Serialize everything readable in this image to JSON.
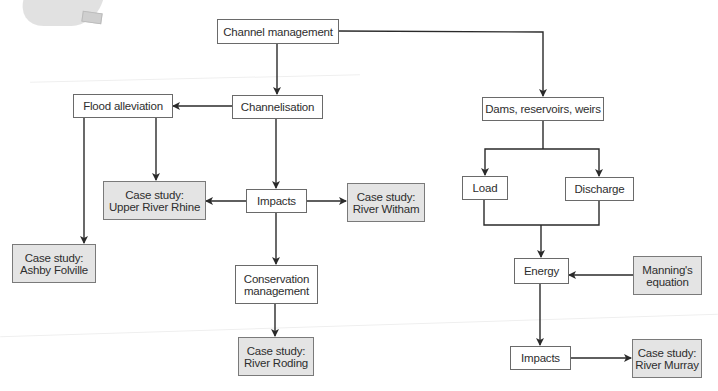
{
  "diagram": {
    "title": "Channel management",
    "colors": {
      "process_fill": "#ffffff",
      "case_study_fill": "#e4e4e4",
      "border": "#6a6a6a",
      "arrow": "#2a2a2a"
    },
    "nodes": {
      "channel_management": {
        "lines": [
          "Channel management"
        ],
        "type": "process"
      },
      "channelisation": {
        "lines": [
          "Channelisation"
        ],
        "type": "process"
      },
      "flood_alleviation": {
        "lines": [
          "Flood alleviation"
        ],
        "type": "process"
      },
      "impacts_left": {
        "lines": [
          "Impacts"
        ],
        "type": "process"
      },
      "case_upper_rhine": {
        "lines": [
          "Case study:",
          "Upper River Rhine"
        ],
        "type": "case_study"
      },
      "case_witham": {
        "lines": [
          "Case study:",
          "River Witham"
        ],
        "type": "case_study"
      },
      "case_ashby": {
        "lines": [
          "Case study:",
          "Ashby Folville"
        ],
        "type": "case_study"
      },
      "conservation_management": {
        "lines": [
          "Conservation",
          "management"
        ],
        "type": "process"
      },
      "case_roding": {
        "lines": [
          "Case study:",
          "River Roding"
        ],
        "type": "case_study"
      },
      "dams": {
        "lines": [
          "Dams, reservoirs, weirs"
        ],
        "type": "process"
      },
      "load": {
        "lines": [
          "Load"
        ],
        "type": "process"
      },
      "discharge": {
        "lines": [
          "Discharge"
        ],
        "type": "process"
      },
      "energy": {
        "lines": [
          "Energy"
        ],
        "type": "process"
      },
      "mannings": {
        "lines": [
          "Manning's",
          "equation"
        ],
        "type": "case_study"
      },
      "impacts_right": {
        "lines": [
          "Impacts"
        ],
        "type": "process"
      },
      "case_murray": {
        "lines": [
          "Case study:",
          "River Murray"
        ],
        "type": "case_study"
      }
    },
    "edges": [
      {
        "from": "Channel management",
        "to": "Channelisation"
      },
      {
        "from": "Channel management",
        "to": "Dams, reservoirs, weirs"
      },
      {
        "from": "Channelisation",
        "to": "Flood alleviation"
      },
      {
        "from": "Channelisation",
        "to": "Impacts"
      },
      {
        "from": "Flood alleviation",
        "to": "Case study: Upper River Rhine"
      },
      {
        "from": "Flood alleviation",
        "to": "Case study: Ashby Folville"
      },
      {
        "from": "Impacts",
        "to": "Case study: Upper River Rhine"
      },
      {
        "from": "Impacts",
        "to": "Case study: River Witham"
      },
      {
        "from": "Impacts",
        "to": "Conservation management"
      },
      {
        "from": "Conservation management",
        "to": "Case study: River Roding"
      },
      {
        "from": "Dams, reservoirs, weirs",
        "to": "Load"
      },
      {
        "from": "Dams, reservoirs, weirs",
        "to": "Discharge"
      },
      {
        "from": "Load",
        "to": "Energy"
      },
      {
        "from": "Discharge",
        "to": "Energy"
      },
      {
        "from": "Manning's equation",
        "to": "Energy"
      },
      {
        "from": "Energy",
        "to": "Impacts"
      },
      {
        "from": "Impacts",
        "to": "Case study: River Murray"
      }
    ]
  }
}
